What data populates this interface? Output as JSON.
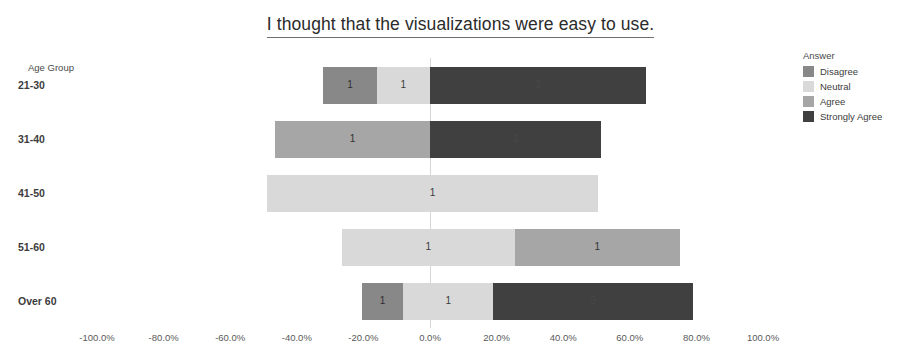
{
  "chart_data": {
    "type": "bar",
    "subtype": "diverging-stacked-bar",
    "title": "I thought that the visualizations were easy to use.",
    "xlabel": "",
    "ylabel": "Age Group",
    "xlim": [
      -100,
      100
    ],
    "xtick_labels": [
      "-100.0%",
      "-80.0%",
      "-60.0%",
      "-40.0%",
      "-20.0%",
      "0.0%",
      "20.0%",
      "40.0%",
      "60.0%",
      "80.0%",
      "100.0%"
    ],
    "xtick_values": [
      -100,
      -80,
      -60,
      -40,
      -20,
      0,
      20,
      40,
      60,
      80,
      100
    ],
    "grid": false,
    "legend_title": "Answer",
    "legend_position": "right",
    "categories": [
      "21-30",
      "31-40",
      "41-50",
      "51-60",
      "Over 60"
    ],
    "series": [
      {
        "name": "Disagree",
        "color": "#888888",
        "values": [
          1,
          0,
          0,
          0,
          1
        ]
      },
      {
        "name": "Neutral",
        "color": "#d9d9d9",
        "values": [
          1,
          0,
          1,
          1,
          1
        ]
      },
      {
        "name": "Agree",
        "color": "#a6a6a6",
        "values": [
          0,
          1,
          0,
          1,
          0
        ]
      },
      {
        "name": "Strongly Agree",
        "color": "#404040",
        "values": [
          2,
          1,
          0,
          0,
          3
        ]
      }
    ],
    "bars": [
      {
        "category": "21-30",
        "segments": [
          {
            "answer": "Disagree",
            "count": 1,
            "label": "1",
            "start_pct": -32.0,
            "end_pct": -16.0,
            "color": "#888888",
            "label_tone": "dark"
          },
          {
            "answer": "Neutral",
            "count": 1,
            "label": "1",
            "start_pct": -16.0,
            "end_pct": 0.0,
            "color": "#d9d9d9",
            "label_tone": "dark"
          },
          {
            "answer": "Strongly Agree",
            "count": 2,
            "label": "2",
            "start_pct": 0.0,
            "end_pct": 65.0,
            "color": "#404040",
            "label_tone": "light"
          }
        ]
      },
      {
        "category": "31-40",
        "segments": [
          {
            "answer": "Agree",
            "count": 1,
            "label": "1",
            "start_pct": -46.5,
            "end_pct": 0.0,
            "color": "#a6a6a6",
            "label_tone": "dark"
          },
          {
            "answer": "Strongly Agree",
            "count": 1,
            "label": "1",
            "start_pct": 0.0,
            "end_pct": 51.5,
            "color": "#404040",
            "label_tone": "light"
          }
        ]
      },
      {
        "category": "41-50",
        "segments": [
          {
            "answer": "Neutral",
            "count": 1,
            "label": "1",
            "start_pct": -49.0,
            "end_pct": 50.5,
            "color": "#d9d9d9",
            "label_tone": "dark"
          }
        ]
      },
      {
        "category": "51-60",
        "segments": [
          {
            "answer": "Neutral",
            "count": 1,
            "label": "1",
            "start_pct": -26.5,
            "end_pct": 25.5,
            "color": "#d9d9d9",
            "label_tone": "dark"
          },
          {
            "answer": "Agree",
            "count": 1,
            "label": "1",
            "start_pct": 25.5,
            "end_pct": 75.0,
            "color": "#a6a6a6",
            "label_tone": "dark"
          }
        ]
      },
      {
        "category": "Over 60",
        "segments": [
          {
            "answer": "Disagree",
            "count": 1,
            "label": "1",
            "start_pct": -20.5,
            "end_pct": -8.0,
            "color": "#888888",
            "label_tone": "dark"
          },
          {
            "answer": "Neutral",
            "count": 1,
            "label": "1",
            "start_pct": -8.0,
            "end_pct": 19.0,
            "color": "#d9d9d9",
            "label_tone": "dark"
          },
          {
            "answer": "Strongly Agree",
            "count": 3,
            "label": "3",
            "start_pct": 19.0,
            "end_pct": 79.0,
            "color": "#404040",
            "label_tone": "light"
          }
        ]
      }
    ]
  }
}
